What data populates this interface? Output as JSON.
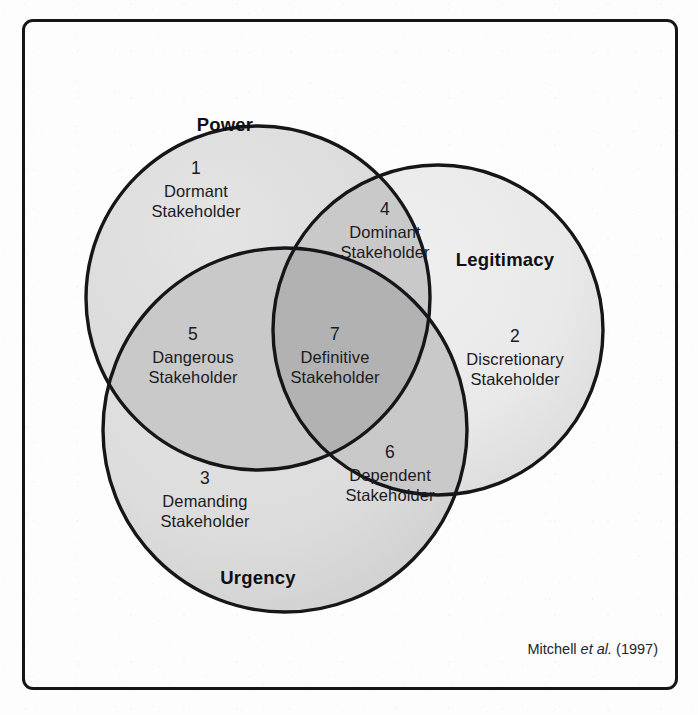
{
  "figure": {
    "type": "venn-diagram-3-set",
    "attribution_prefix": "Mitchell ",
    "attribution_italic": "et al.",
    "attribution_suffix": " (1997)"
  },
  "sets": [
    {
      "key": "power",
      "title": "Power",
      "fill": "#dcdcdc"
    },
    {
      "key": "legitimacy",
      "title": "Legitimacy",
      "fill": "#e9e9e9"
    },
    {
      "key": "urgency",
      "title": "Urgency",
      "fill": "#dcdcdc"
    }
  ],
  "regions": [
    {
      "number": "1",
      "name_line1": "Dormant",
      "name_line2": "Stakeholder",
      "sets": "power"
    },
    {
      "number": "2",
      "name_line1": "Discretionary",
      "name_line2": "Stakeholder",
      "sets": "legitimacy"
    },
    {
      "number": "3",
      "name_line1": "Demanding",
      "name_line2": "Stakeholder",
      "sets": "urgency"
    },
    {
      "number": "4",
      "name_line1": "Dominant",
      "name_line2": "Stakeholder",
      "sets": "power+legitimacy"
    },
    {
      "number": "5",
      "name_line1": "Dangerous",
      "name_line2": "Stakeholder",
      "sets": "power+urgency"
    },
    {
      "number": "6",
      "name_line1": "Dependent",
      "name_line2": "Stakeholder",
      "sets": "legitimacy+urgency"
    },
    {
      "number": "7",
      "name_line1": "Definitive",
      "name_line2": "Stakeholder",
      "sets": "power+legitimacy+urgency"
    }
  ],
  "colors": {
    "outline": "#16161a",
    "frame": "#16161a",
    "text": "#1b1b1f",
    "fill_power": "#dcdcdc",
    "fill_legitimacy": "#e9e9e9",
    "fill_urgency": "#dcdcdc",
    "fill_pair": "#c9c9c9",
    "fill_triple": "#b4b4b4",
    "paper": "#fdfdfd"
  }
}
